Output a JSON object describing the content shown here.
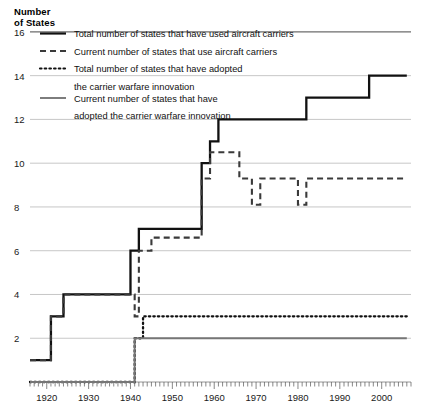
{
  "chart_data": {
    "type": "line",
    "title": "",
    "ylabel": "Number\nof States",
    "xlabel": "",
    "xlim": [
      1916,
      2007
    ],
    "ylim": [
      0,
      17
    ],
    "yticks": [
      2,
      4,
      6,
      8,
      10,
      12,
      14,
      16
    ],
    "xticks": [
      1920,
      1930,
      1940,
      1950,
      1960,
      1970,
      1980,
      1990,
      2000
    ],
    "xtick_minor_interval": 1,
    "grid": "horizontal",
    "legend_position": "top-left-inside",
    "step_style": "post",
    "series": [
      {
        "name": "Total number of states that have used aircraft carriers",
        "style": "solid",
        "color": "#111111",
        "x": [
          1916,
          1921,
          1921,
          1924,
          1924,
          1940,
          1940,
          1942,
          1942,
          1957,
          1957,
          1959,
          1959,
          1961,
          1961,
          1982,
          1982,
          1990,
          1990,
          1997,
          1997,
          2006
        ],
        "y": [
          1,
          1,
          3,
          3,
          4,
          4,
          6,
          6,
          7,
          7,
          10,
          10,
          11,
          11,
          12,
          12,
          13,
          13,
          13,
          13,
          14,
          14
        ],
        "points": [
          {
            "year": 1916,
            "value": 1
          },
          {
            "year": 1921,
            "value": 3
          },
          {
            "year": 1924,
            "value": 4
          },
          {
            "year": 1940,
            "value": 6
          },
          {
            "year": 1942,
            "value": 7
          },
          {
            "year": 1957,
            "value": 10
          },
          {
            "year": 1959,
            "value": 11
          },
          {
            "year": 1961,
            "value": 12
          },
          {
            "year": 1982,
            "value": 13
          },
          {
            "year": 1997,
            "value": 14
          },
          {
            "year": 2006,
            "value": 14
          }
        ]
      },
      {
        "name": "Current number of states that use aircraft carriers",
        "style": "dashed",
        "color": "#3a3a3a",
        "x": [
          1916,
          1921,
          1921,
          1924,
          1924,
          1940,
          1940,
          1941,
          1941,
          1942,
          1942,
          1945,
          1945,
          1957,
          1957,
          1959,
          1959,
          1964,
          1964,
          1966,
          1966,
          1969,
          1969,
          1971,
          1971,
          1975,
          1975,
          1980,
          1980,
          1982,
          1982,
          1984,
          1984,
          2006
        ],
        "y": [
          1,
          1,
          3,
          3,
          4,
          4,
          4,
          4,
          3,
          3,
          6,
          6,
          6.6,
          6.6,
          9.3,
          9.3,
          10.5,
          10.5,
          10.5,
          10.5,
          9.3,
          9.3,
          8.1,
          8.1,
          9.3,
          9.3,
          9.3,
          9.3,
          8.1,
          8.1,
          9.3,
          9.3,
          9.3,
          9.3
        ],
        "points": [
          {
            "year": 1916,
            "value": 1
          },
          {
            "year": 1921,
            "value": 3
          },
          {
            "year": 1924,
            "value": 4
          },
          {
            "year": 1941,
            "value": 3
          },
          {
            "year": 1942,
            "value": 6
          },
          {
            "year": 1945,
            "value": 6.6
          },
          {
            "year": 1957,
            "value": 9.3
          },
          {
            "year": 1959,
            "value": 10.5
          },
          {
            "year": 1966,
            "value": 9.3
          },
          {
            "year": 1969,
            "value": 8.1
          },
          {
            "year": 1971,
            "value": 9.3
          },
          {
            "year": 1980,
            "value": 8.1
          },
          {
            "year": 1982,
            "value": 9.3
          },
          {
            "year": 2006,
            "value": 9.3
          }
        ]
      },
      {
        "name": "Total number of states that have adopted the carrier warfare innovation",
        "style": "dotted",
        "color": "#111111",
        "x": [
          1916,
          1941,
          1941,
          1943,
          1943,
          2006
        ],
        "y": [
          0,
          0,
          2,
          2,
          3,
          3
        ],
        "points": [
          {
            "year": 1916,
            "value": 0
          },
          {
            "year": 1941,
            "value": 2
          },
          {
            "year": 1943,
            "value": 3
          },
          {
            "year": 2006,
            "value": 3
          }
        ]
      },
      {
        "name": "Current number of states that have adopted the carrier warfare innovation",
        "style": "solid-gray",
        "color": "#767676",
        "x": [
          1916,
          1941,
          1941,
          1943,
          1943,
          2006
        ],
        "y": [
          0,
          0,
          2,
          2,
          2,
          2
        ],
        "points": [
          {
            "year": 1916,
            "value": 0
          },
          {
            "year": 1941,
            "value": 2
          },
          {
            "year": 2006,
            "value": 2
          }
        ]
      }
    ]
  },
  "legend": {
    "entries": [
      {
        "swatch": "solid-black-line",
        "label": "Total number of states that have used aircraft carriers"
      },
      {
        "swatch": "dashed-line",
        "label": "Current number of states that use aircraft carriers"
      },
      {
        "swatch": "dotted-line",
        "label": "Total number of states that have adopted"
      },
      {
        "swatch": "none",
        "label": "the carrier warfare innovation"
      },
      {
        "swatch": "solid-gray-line",
        "label": "Current number of states that have"
      },
      {
        "swatch": "none",
        "label": "adopted the carrier warfare innovation"
      }
    ]
  },
  "colors": {
    "total_used": "#111111",
    "current_use": "#3a3a3a",
    "adopted_total": "#111111",
    "adopted_current": "#767676",
    "gridline": "#b9b9b9",
    "axis": "#8a8a8a"
  }
}
